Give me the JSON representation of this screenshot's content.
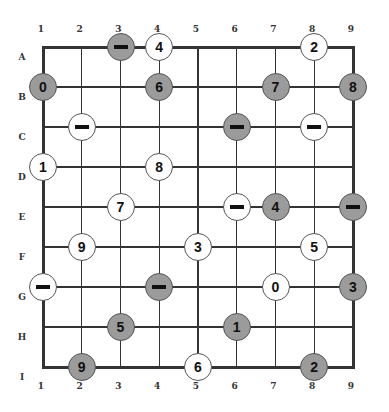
{
  "puzzle": {
    "columns": [
      "1",
      "2",
      "3",
      "4",
      "5",
      "6",
      "7",
      "8",
      "9"
    ],
    "rows": [
      "A",
      "B",
      "C",
      "D",
      "E",
      "F",
      "G",
      "H",
      "I"
    ],
    "colors": {
      "grey_fill": "#9b9b9b",
      "white_fill": "#ffffff",
      "line": "#333333"
    },
    "nodes": [
      {
        "row": "A",
        "col": 3,
        "fill": "grey",
        "value": "-"
      },
      {
        "row": "A",
        "col": 4,
        "fill": "white",
        "value": "4"
      },
      {
        "row": "A",
        "col": 8,
        "fill": "white",
        "value": "2"
      },
      {
        "row": "B",
        "col": 1,
        "fill": "grey",
        "value": "0"
      },
      {
        "row": "B",
        "col": 4,
        "fill": "grey",
        "value": "6"
      },
      {
        "row": "B",
        "col": 7,
        "fill": "grey",
        "value": "7"
      },
      {
        "row": "B",
        "col": 9,
        "fill": "grey",
        "value": "8"
      },
      {
        "row": "C",
        "col": 2,
        "fill": "white",
        "value": "-"
      },
      {
        "row": "C",
        "col": 6,
        "fill": "grey",
        "value": "-"
      },
      {
        "row": "C",
        "col": 8,
        "fill": "white",
        "value": "-"
      },
      {
        "row": "D",
        "col": 1,
        "fill": "white",
        "value": "1"
      },
      {
        "row": "D",
        "col": 4,
        "fill": "white",
        "value": "8"
      },
      {
        "row": "E",
        "col": 3,
        "fill": "white",
        "value": "7"
      },
      {
        "row": "E",
        "col": 6,
        "fill": "white",
        "value": "-"
      },
      {
        "row": "E",
        "col": 7,
        "fill": "grey",
        "value": "4"
      },
      {
        "row": "E",
        "col": 9,
        "fill": "grey",
        "value": "-"
      },
      {
        "row": "F",
        "col": 2,
        "fill": "white",
        "value": "9"
      },
      {
        "row": "F",
        "col": 5,
        "fill": "white",
        "value": "3"
      },
      {
        "row": "F",
        "col": 8,
        "fill": "white",
        "value": "5"
      },
      {
        "row": "G",
        "col": 1,
        "fill": "white",
        "value": "-"
      },
      {
        "row": "G",
        "col": 4,
        "fill": "grey",
        "value": "-"
      },
      {
        "row": "G",
        "col": 7,
        "fill": "white",
        "value": "0"
      },
      {
        "row": "G",
        "col": 9,
        "fill": "grey",
        "value": "3"
      },
      {
        "row": "H",
        "col": 3,
        "fill": "grey",
        "value": "5"
      },
      {
        "row": "H",
        "col": 6,
        "fill": "grey",
        "value": "1"
      },
      {
        "row": "I",
        "col": 2,
        "fill": "grey",
        "value": "9"
      },
      {
        "row": "I",
        "col": 5,
        "fill": "white",
        "value": "6"
      },
      {
        "row": "I",
        "col": 8,
        "fill": "grey",
        "value": "2"
      }
    ]
  }
}
